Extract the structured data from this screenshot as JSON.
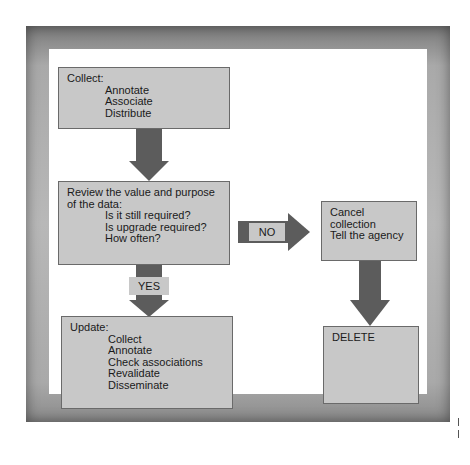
{
  "diagram": {
    "collect_box": {
      "title": "Collect:",
      "items": [
        "Annotate",
        "Associate",
        "Distribute"
      ]
    },
    "review_box": {
      "title_line1": "Review the value and purpose",
      "title_line2": "of the data:",
      "items": [
        "Is it still required?",
        "Is upgrade required?",
        "How often?"
      ]
    },
    "cancel_box": {
      "lines": [
        "Cancel collection",
        "Tell the agency"
      ]
    },
    "update_box": {
      "title": "Update:",
      "items": [
        "Collect",
        "Annotate",
        "Check associations",
        "Revalidate",
        "Disseminate"
      ]
    },
    "delete_box": {
      "label": "DELETE"
    },
    "yes_label": "YES",
    "no_label": "NO"
  },
  "colors": {
    "box_fill": "#c8c8c8",
    "arrow": "#5c5c5c",
    "frame": "#a9a9a9"
  }
}
